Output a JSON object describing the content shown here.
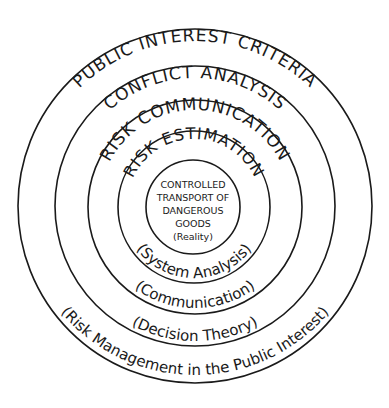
{
  "diagram": {
    "type": "concentric-circles",
    "center_label": {
      "lines": [
        "CONTROLLED",
        "TRANSPORT OF",
        "DANGEROUS",
        "GOODS",
        "(Reality)"
      ]
    },
    "rings": [
      {
        "title": "RISK ESTIMATION",
        "subtitle": "(System Analysis)"
      },
      {
        "title": "RISK COMMUNICATION",
        "subtitle": "(Communication)"
      },
      {
        "title": "CONFLICT ANALYSIS",
        "subtitle": "(Decision Theory)"
      },
      {
        "title": "PUBLIC INTEREST CRITERIA",
        "subtitle": "(Risk Management in the Public Interest)"
      }
    ]
  }
}
